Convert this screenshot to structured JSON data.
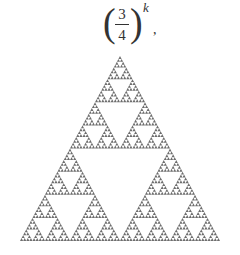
{
  "formula": {
    "open_paren": "(",
    "numerator": "3",
    "denominator": "4",
    "close_paren": ")",
    "exponent": "k",
    "trailing": ","
  },
  "figure": {
    "type": "sierpinski-triangle",
    "apex": [
      120,
      56
    ],
    "bottom_left": [
      20,
      241
    ],
    "bottom_right": [
      220,
      241
    ],
    "depth": 6,
    "fill_color": "#6e6e6e",
    "background": "#ffffff"
  }
}
